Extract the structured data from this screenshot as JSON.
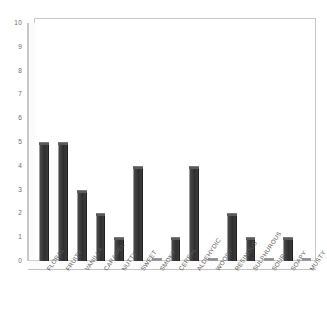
{
  "chart_data": {
    "type": "bar",
    "title": "",
    "xlabel": "",
    "ylabel": "",
    "ylim": [
      0,
      10
    ],
    "ytick_labels": [
      "10",
      "9",
      "8",
      "7",
      "6",
      "5",
      "4",
      "3",
      "2",
      "1",
      "0"
    ],
    "yticks": [
      10,
      9,
      8,
      7,
      6,
      5,
      4,
      3,
      2,
      1,
      0
    ],
    "grid": false,
    "legend": "none",
    "bar_color": "#333333",
    "plot_border_color": "#c8c8c8",
    "background_color": "#ffffff",
    "categories": [
      "FLORAL",
      "FRUITY",
      "VANILLA",
      "CARAMEL",
      "NUTTY",
      "SWEET",
      "SMOKY",
      "CEREAL",
      "ALDEHYDIC",
      "WOODY",
      "RESINOUS",
      "SULPHUROUS",
      "SOUR",
      "SOAPY",
      "MUSTY"
    ],
    "values": [
      5,
      5,
      3,
      2,
      1,
      4,
      0,
      1,
      4,
      0,
      2,
      1,
      0,
      1,
      0
    ]
  }
}
